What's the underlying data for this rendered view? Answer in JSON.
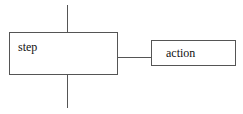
{
  "diagram": {
    "step_label": "step",
    "action_label": "action",
    "stroke_color": "#555555"
  }
}
